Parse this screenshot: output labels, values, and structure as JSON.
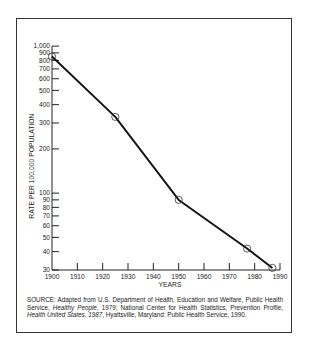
{
  "chart_data": {
    "type": "line",
    "title": "",
    "xlabel": "YEARS",
    "ylabel": "RATE PER 100,000 POPULATION",
    "yscale": "log",
    "xlim": [
      1900,
      1990
    ],
    "ylim": [
      30,
      1000
    ],
    "x_ticks": [
      1900,
      1910,
      1920,
      1930,
      1940,
      1950,
      1960,
      1970,
      1980,
      1990
    ],
    "y_ticks": [
      30,
      40,
      50,
      60,
      70,
      80,
      90,
      100,
      200,
      300,
      400,
      500,
      600,
      700,
      800,
      900,
      1000
    ],
    "y_tick_labels": [
      "30",
      "40",
      "50",
      "60",
      "70",
      "80",
      "90",
      "100",
      "200",
      "300",
      "400",
      "500",
      "600",
      "700",
      "800",
      "900",
      "1,000"
    ],
    "grid": false,
    "legend": null,
    "series": [
      {
        "name": "Rate per 100,000 population",
        "marker": "open-circle",
        "points": [
          {
            "x": 1900,
            "y": 850
          },
          {
            "x": 1925,
            "y": 330
          },
          {
            "x": 1950,
            "y": 90
          },
          {
            "x": 1977,
            "y": 42
          },
          {
            "x": 1987,
            "y": 31
          }
        ]
      }
    ]
  },
  "source_note": {
    "prefix": "SOURCE: Adapted from U.S. Department of Health, Education and Welfare, Public Health Service, ",
    "italic_1": "Healthy People",
    "mid_1": ", 1979; National Center for Health Statistics, Prevention Profile, ",
    "italic_2": "Health United States, 1987",
    "suffix": ", Hyattsville, Maryland: Public Health Service, 1990."
  }
}
